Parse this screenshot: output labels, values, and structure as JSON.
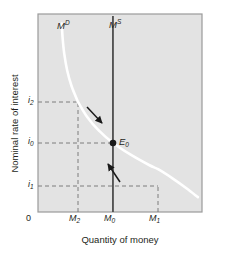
{
  "figure": {
    "axes": {
      "y_title": "Nominal rate of interest",
      "x_title": "Quantity of money",
      "origin_label": "0",
      "y_ticks": [
        {
          "id": "i2",
          "base": "i",
          "sub": "2",
          "value_y": 102
        },
        {
          "id": "i0",
          "base": "i",
          "sub": "0",
          "value_y": 143
        },
        {
          "id": "i1",
          "base": "i",
          "sub": "1",
          "value_y": 186
        }
      ],
      "x_ticks": [
        {
          "id": "M2",
          "base": "M",
          "sub": "2",
          "value_x": 78
        },
        {
          "id": "M0",
          "base": "M",
          "sub": "0",
          "value_x": 113
        },
        {
          "id": "M1",
          "base": "M",
          "sub": "1",
          "value_x": 158
        }
      ]
    },
    "curves": [
      {
        "id": "money-demand",
        "base": "M",
        "sup": "D",
        "label_x": 58,
        "label_y": 22,
        "color": "#ffffff"
      },
      {
        "id": "money-supply",
        "base": "M",
        "sup": "S",
        "label_x": 110,
        "label_y": 21,
        "color": "#4d4d4d"
      }
    ],
    "equilibrium": {
      "base": "E",
      "sub": "0",
      "point_x": 113,
      "point_y": 143,
      "label_x": 119,
      "label_y": 137
    },
    "arrows": [
      {
        "id": "arrow-upper",
        "direction": "down-right"
      },
      {
        "id": "arrow-lower",
        "direction": "up-left"
      }
    ],
    "colors": {
      "plot_background": "#e3e3e3",
      "plot_border": "#9a9a9a",
      "demand_curve": "#ffffff",
      "supply_curve": "#4d4d4d",
      "dashed_guide": "#7a7a7a",
      "text": "#231f20",
      "equilibrium_dot": "#1a1a1a"
    }
  },
  "chart_data": {
    "type": "line",
    "title": "",
    "xlabel": "Quantity of money",
    "ylabel": "Nominal rate of interest",
    "xlim": [
      0,
      1
    ],
    "ylim": [
      0,
      1
    ],
    "grid": false,
    "legend": "none",
    "xtick_labels": [
      "0",
      "M2",
      "M0",
      "M1"
    ],
    "ytick_labels": [
      "i1",
      "i0",
      "i2"
    ],
    "series": [
      {
        "name": "MD",
        "type": "curve",
        "style": "solid-white",
        "points": [
          [
            0.145,
            0.952
          ],
          [
            0.15,
            0.88
          ],
          [
            0.16,
            0.8
          ],
          [
            0.178,
            0.715
          ],
          [
            0.205,
            0.635
          ],
          [
            0.244,
            0.556
          ],
          [
            0.244,
            0.556
          ],
          [
            0.3,
            0.48
          ],
          [
            0.37,
            0.412
          ],
          [
            0.456,
            0.35
          ],
          [
            0.56,
            0.292
          ],
          [
            0.68,
            0.236
          ],
          [
            0.732,
            0.216
          ],
          [
            0.82,
            0.17
          ],
          [
            0.905,
            0.12
          ],
          [
            0.975,
            0.075
          ]
        ]
      },
      {
        "name": "MS",
        "type": "vertical-line",
        "style": "solid-dark",
        "x": 0.457,
        "y_range": [
          0.0,
          1.0
        ]
      }
    ],
    "annotations": [
      {
        "text": "MD",
        "x": 0.12,
        "y": 0.96
      },
      {
        "text": "MS",
        "x": 0.44,
        "y": 0.97
      },
      {
        "text": "E0",
        "x": 0.49,
        "y": 0.38
      },
      {
        "text": "arrow pointing down-right toward equilibrium",
        "x": 0.33,
        "y": 0.5
      },
      {
        "text": "arrow pointing up-left toward equilibrium",
        "x": 0.46,
        "y": 0.22
      }
    ],
    "guides": [
      {
        "type": "hline",
        "y": 0.556,
        "x_to": 0.244,
        "label": "i2",
        "dashed": true
      },
      {
        "type": "hline",
        "y": 0.35,
        "x_to": 0.457,
        "label": "i0",
        "dashed": true
      },
      {
        "type": "hline",
        "y": 0.133,
        "x_to": 0.732,
        "label": "i1",
        "dashed": true
      },
      {
        "type": "vline",
        "x": 0.244,
        "y_to": 0.556,
        "label": "M2",
        "dashed": true
      },
      {
        "type": "vline",
        "x": 0.732,
        "y_to": 0.133,
        "label": "M1",
        "dashed": true
      }
    ]
  }
}
